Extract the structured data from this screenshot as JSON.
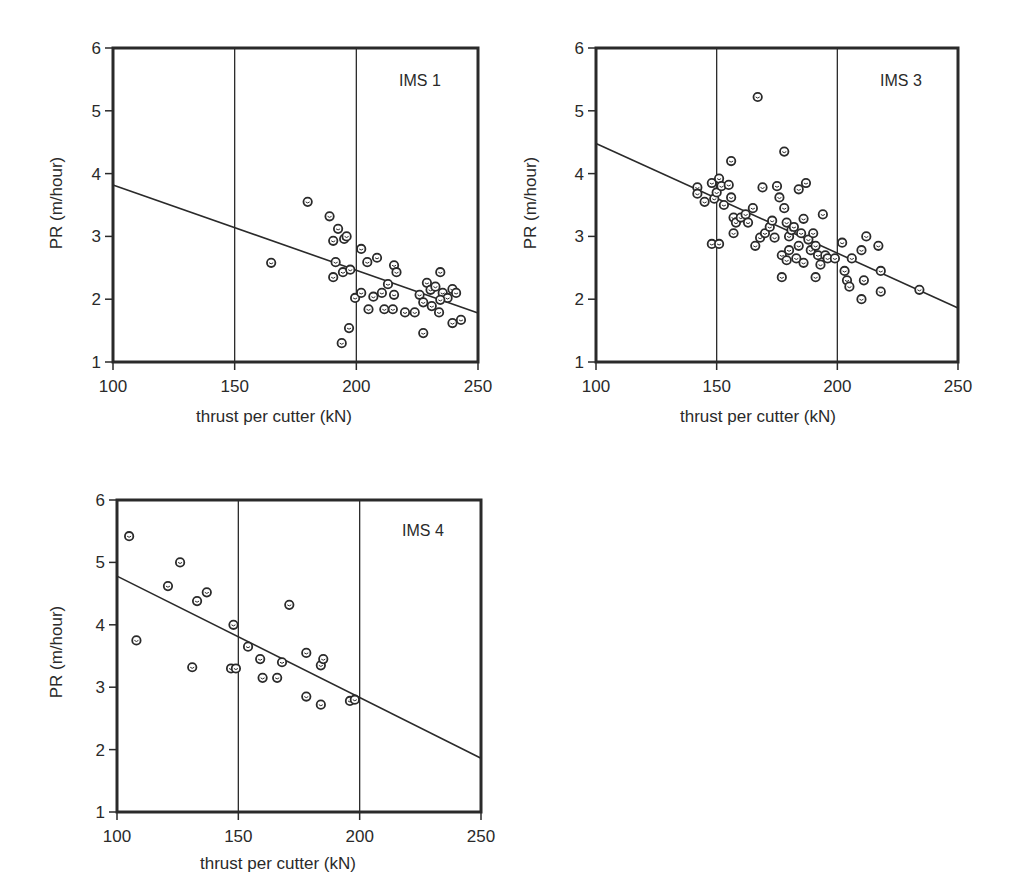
{
  "chart_data": [
    {
      "type": "scatter",
      "title": "IMS 1",
      "xlabel": "thrust per cutter (kN)",
      "ylabel": "PR (m/hour)",
      "xlim": [
        100,
        250
      ],
      "ylim": [
        1,
        6
      ],
      "xticks": [
        100,
        150,
        200,
        250
      ],
      "yticks": [
        1,
        2,
        3,
        4,
        5,
        6
      ],
      "vertical_gridlines": [
        150,
        200
      ],
      "regression_line": [
        [
          100,
          3.82
        ],
        [
          250,
          1.78
        ]
      ],
      "points": [
        [
          165,
          2.58
        ],
        [
          180,
          3.55
        ],
        [
          189,
          3.32
        ],
        [
          192.5,
          3.12
        ],
        [
          195,
          2.96
        ],
        [
          196,
          3.0
        ],
        [
          190.5,
          2.93
        ],
        [
          191.5,
          2.59
        ],
        [
          190.5,
          2.35
        ],
        [
          194.5,
          2.43
        ],
        [
          197.5,
          2.47
        ],
        [
          194,
          1.3
        ],
        [
          197,
          1.54
        ],
        [
          199.5,
          2.02
        ],
        [
          202,
          2.1
        ],
        [
          202,
          2.8
        ],
        [
          204.5,
          2.59
        ],
        [
          208.5,
          2.66
        ],
        [
          205,
          1.84
        ],
        [
          207,
          2.04
        ],
        [
          210.5,
          2.1
        ],
        [
          213,
          2.24
        ],
        [
          211.5,
          1.84
        ],
        [
          215,
          1.84
        ],
        [
          215.5,
          2.54
        ],
        [
          216.5,
          2.43
        ],
        [
          215.5,
          2.07
        ],
        [
          220,
          1.79
        ],
        [
          224,
          1.79
        ],
        [
          227.5,
          1.46
        ],
        [
          226,
          2.07
        ],
        [
          227.5,
          1.95
        ],
        [
          229,
          2.26
        ],
        [
          230.5,
          2.15
        ],
        [
          231,
          1.89
        ],
        [
          232.5,
          2.2
        ],
        [
          234.5,
          2.43
        ],
        [
          234,
          1.79
        ],
        [
          235.5,
          2.1
        ],
        [
          237.5,
          2.02
        ],
        [
          239.5,
          2.16
        ],
        [
          241,
          2.1
        ],
        [
          239.5,
          1.62
        ],
        [
          243,
          1.67
        ],
        [
          234.5,
          1.99
        ]
      ]
    },
    {
      "type": "scatter",
      "title": "IMS 3",
      "xlabel": "thrust per cutter (kN)",
      "ylabel": "PR (m/hour)",
      "xlim": [
        100,
        250
      ],
      "ylim": [
        1,
        6
      ],
      "xticks": [
        100,
        150,
        200,
        250
      ],
      "yticks": [
        1,
        2,
        3,
        4,
        5,
        6
      ],
      "vertical_gridlines": [
        150,
        200
      ],
      "regression_line": [
        [
          100,
          4.48
        ],
        [
          250,
          1.86
        ]
      ],
      "points": [
        [
          142,
          3.78
        ],
        [
          142,
          3.68
        ],
        [
          145,
          3.55
        ],
        [
          148,
          3.85
        ],
        [
          149,
          3.6
        ],
        [
          150,
          3.7
        ],
        [
          151,
          3.92
        ],
        [
          152,
          3.8
        ],
        [
          153,
          3.5
        ],
        [
          155,
          3.82
        ],
        [
          156,
          3.62
        ],
        [
          148,
          2.88
        ],
        [
          151,
          2.88
        ],
        [
          156,
          4.2
        ],
        [
          157,
          3.3
        ],
        [
          158,
          3.22
        ],
        [
          160,
          3.3
        ],
        [
          162,
          3.35
        ],
        [
          163,
          3.22
        ],
        [
          157,
          3.05
        ],
        [
          165,
          3.45
        ],
        [
          166,
          2.85
        ],
        [
          167,
          5.22
        ],
        [
          168,
          2.98
        ],
        [
          169,
          3.78
        ],
        [
          170,
          3.05
        ],
        [
          172,
          3.15
        ],
        [
          173,
          3.25
        ],
        [
          174,
          2.98
        ],
        [
          175,
          3.8
        ],
        [
          176,
          3.62
        ],
        [
          177,
          2.7
        ],
        [
          178,
          4.35
        ],
        [
          178,
          3.45
        ],
        [
          179,
          3.22
        ],
        [
          179,
          2.62
        ],
        [
          180,
          3.0
        ],
        [
          180,
          2.78
        ],
        [
          181,
          3.1
        ],
        [
          182,
          3.15
        ],
        [
          183,
          2.65
        ],
        [
          184,
          3.75
        ],
        [
          184,
          2.85
        ],
        [
          185,
          3.05
        ],
        [
          186,
          3.28
        ],
        [
          186,
          2.58
        ],
        [
          187,
          3.85
        ],
        [
          188,
          2.95
        ],
        [
          189,
          2.78
        ],
        [
          190,
          3.05
        ],
        [
          191,
          2.85
        ],
        [
          192,
          2.7
        ],
        [
          193,
          2.55
        ],
        [
          194,
          3.35
        ],
        [
          177,
          2.35
        ],
        [
          191,
          2.35
        ],
        [
          195,
          2.7
        ],
        [
          196,
          2.65
        ],
        [
          199,
          2.65
        ],
        [
          202,
          2.9
        ],
        [
          203,
          2.45
        ],
        [
          204,
          2.3
        ],
        [
          205,
          2.2
        ],
        [
          206,
          2.65
        ],
        [
          210,
          2.78
        ],
        [
          210,
          2.0
        ],
        [
          211,
          2.3
        ],
        [
          212,
          3.0
        ],
        [
          217,
          2.85
        ],
        [
          218,
          2.45
        ],
        [
          218,
          2.12
        ],
        [
          234,
          2.15
        ]
      ]
    },
    {
      "type": "scatter",
      "title": "IMS 4",
      "xlabel": "thrust per cutter (kN)",
      "ylabel": "PR (m/hour)",
      "xlim": [
        100,
        250
      ],
      "ylim": [
        1,
        6
      ],
      "xticks": [
        100,
        150,
        200,
        250
      ],
      "yticks": [
        1,
        2,
        3,
        4,
        5,
        6
      ],
      "vertical_gridlines": [
        150,
        200
      ],
      "regression_line": [
        [
          100,
          4.78
        ],
        [
          250,
          1.86
        ]
      ],
      "points": [
        [
          105,
          5.42
        ],
        [
          108,
          3.75
        ],
        [
          121,
          4.62
        ],
        [
          126,
          5.0
        ],
        [
          131,
          3.32
        ],
        [
          133,
          4.38
        ],
        [
          137,
          4.52
        ],
        [
          147,
          3.3
        ],
        [
          148,
          4.0
        ],
        [
          149,
          3.3
        ],
        [
          154,
          3.65
        ],
        [
          159,
          3.45
        ],
        [
          160,
          3.15
        ],
        [
          166,
          3.15
        ],
        [
          168,
          3.4
        ],
        [
          171,
          4.32
        ],
        [
          178,
          2.85
        ],
        [
          178,
          3.55
        ],
        [
          184,
          2.72
        ],
        [
          184,
          3.35
        ],
        [
          185,
          3.45
        ],
        [
          196,
          2.78
        ],
        [
          198,
          2.8
        ]
      ]
    }
  ],
  "panels": [
    {
      "label": "IMS 1",
      "x_axis_title": "thrust per cutter (kN)",
      "y_axis_title": "PR (m/hour)"
    },
    {
      "label": "IMS 3",
      "x_axis_title": "thrust per cutter (kN)",
      "y_axis_title": "PR (m/hour)"
    },
    {
      "label": "IMS 4",
      "x_axis_title": "thrust per cutter (kN)",
      "y_axis_title": "PR (m/hour)"
    }
  ],
  "style": {
    "ink": "#2a2a2a",
    "background": "#ffffff"
  }
}
